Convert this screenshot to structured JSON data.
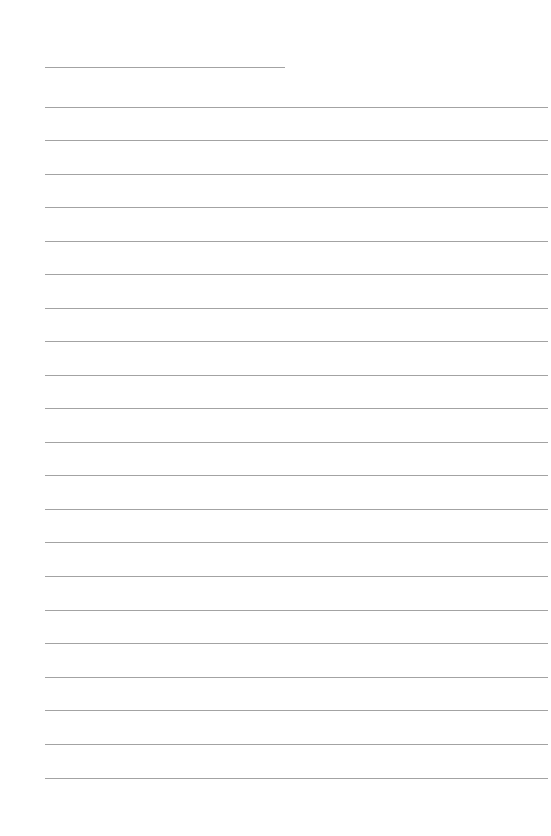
{
  "page": {
    "type": "blank lined writing paper",
    "line_color": "#a3a3a3",
    "background_color": "#ffffff"
  },
  "short_line": {
    "y": 67,
    "x_start": 45,
    "x_end": 285
  },
  "ruled_lines": {
    "x_start": 45,
    "x_end": 548,
    "y_positions": [
      107,
      140,
      174,
      207,
      241,
      274,
      308,
      341,
      375,
      408,
      442,
      475,
      509,
      542,
      576,
      610,
      643,
      677,
      710,
      744,
      778
    ]
  }
}
